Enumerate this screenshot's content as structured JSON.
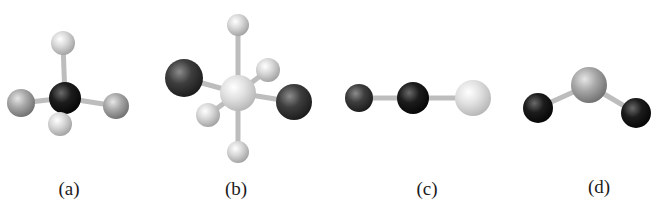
{
  "figure": {
    "panels": [
      {
        "id": "a",
        "label": "(a)",
        "label_pos": [
          69,
          178
        ],
        "geometry": "tetrahedral",
        "atoms": [
          {
            "x": 63,
            "y": 43,
            "r": 12,
            "shade": "light"
          },
          {
            "x": 21,
            "y": 103,
            "r": 14,
            "shade": "mid"
          },
          {
            "x": 116,
            "y": 106,
            "r": 13,
            "shade": "mid"
          },
          {
            "x": 65,
            "y": 98,
            "r": 16,
            "shade": "black"
          },
          {
            "x": 60,
            "y": 124,
            "r": 12,
            "shade": "light"
          }
        ],
        "bonds": [
          [
            3,
            0
          ],
          [
            3,
            1
          ],
          [
            3,
            2
          ],
          [
            3,
            4
          ]
        ]
      },
      {
        "id": "b",
        "label": "(b)",
        "label_pos": [
          236,
          178
        ],
        "geometry": "octahedral",
        "atoms": [
          {
            "x": 238,
            "y": 25,
            "r": 11,
            "shade": "light"
          },
          {
            "x": 268,
            "y": 70,
            "r": 12,
            "shade": "light"
          },
          {
            "x": 184,
            "y": 78,
            "r": 19,
            "shade": "dark"
          },
          {
            "x": 238,
            "y": 93,
            "r": 18,
            "shade": "pale"
          },
          {
            "x": 294,
            "y": 102,
            "r": 18,
            "shade": "dark"
          },
          {
            "x": 208,
            "y": 115,
            "r": 12,
            "shade": "light"
          },
          {
            "x": 238,
            "y": 152,
            "r": 11,
            "shade": "light"
          }
        ],
        "bonds": [
          [
            3,
            0
          ],
          [
            3,
            1
          ],
          [
            3,
            2
          ],
          [
            3,
            4
          ],
          [
            3,
            5
          ],
          [
            3,
            6
          ]
        ]
      },
      {
        "id": "c",
        "label": "(c)",
        "label_pos": [
          427,
          178
        ],
        "geometry": "linear",
        "atoms": [
          {
            "x": 359,
            "y": 98,
            "r": 14,
            "shade": "dark"
          },
          {
            "x": 413,
            "y": 98,
            "r": 16,
            "shade": "black"
          },
          {
            "x": 473,
            "y": 98,
            "r": 18,
            "shade": "pale"
          }
        ],
        "bonds": [
          [
            0,
            1
          ],
          [
            1,
            2
          ]
        ]
      },
      {
        "id": "d",
        "label": "(d)",
        "label_pos": [
          599,
          176
        ],
        "geometry": "bent",
        "atoms": [
          {
            "x": 538,
            "y": 108,
            "r": 15,
            "shade": "black"
          },
          {
            "x": 636,
            "y": 113,
            "r": 15,
            "shade": "black"
          },
          {
            "x": 589,
            "y": 85,
            "r": 18,
            "shade": "mid"
          }
        ],
        "bonds": [
          [
            2,
            0
          ],
          [
            2,
            1
          ]
        ]
      }
    ],
    "shades": {
      "black": {
        "hi": "#6a6a6a",
        "base": "#1c1c1c",
        "lo": "#050505"
      },
      "dark": {
        "hi": "#8c8c8c",
        "base": "#3e3e3e",
        "lo": "#1a1a1a"
      },
      "mid": {
        "hi": "#e6e6e6",
        "base": "#a9a9a9",
        "lo": "#6e6e6e"
      },
      "light": {
        "hi": "#ffffff",
        "base": "#d8d8d8",
        "lo": "#a0a0a0"
      },
      "pale": {
        "hi": "#ffffff",
        "base": "#e2e2e2",
        "lo": "#b5b5b5"
      }
    },
    "bond_color": "#bdbdbd",
    "bond_width": 5
  }
}
